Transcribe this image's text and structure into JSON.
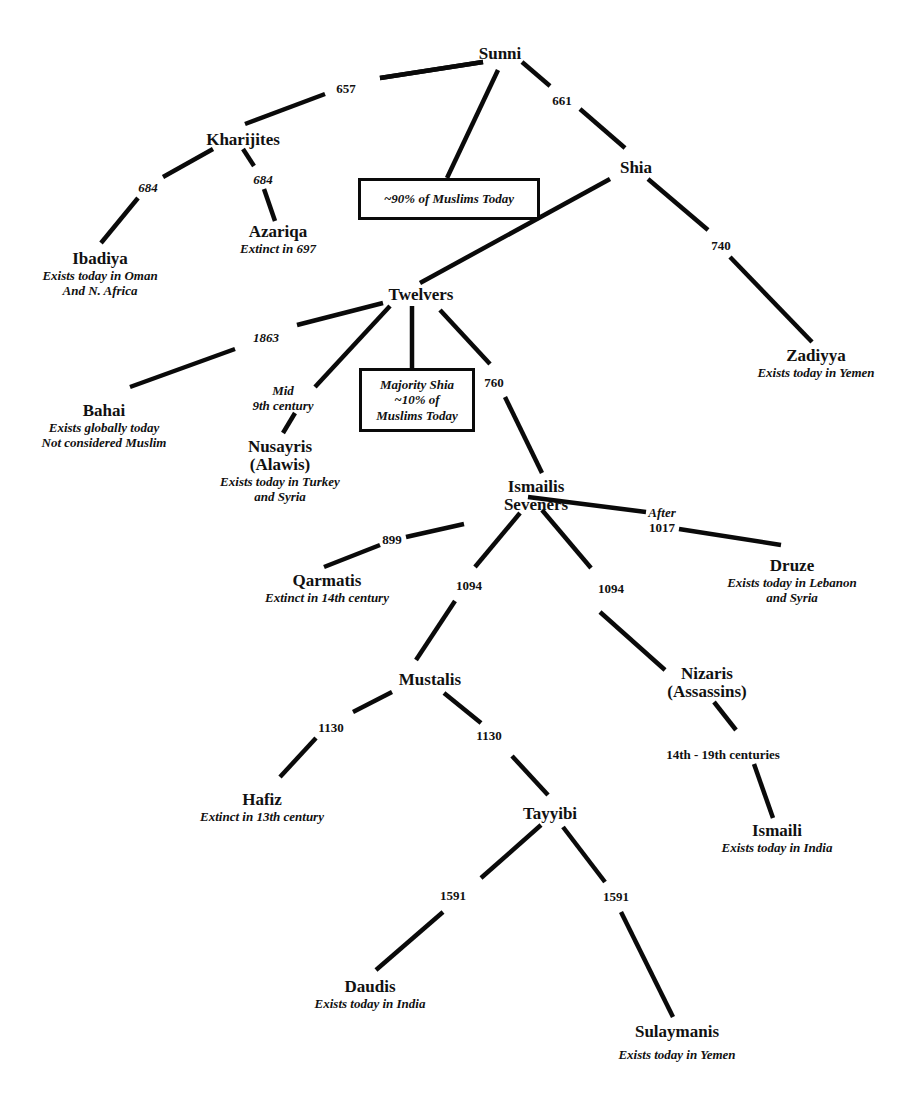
{
  "diagram": {
    "nodes": {
      "sunni": {
        "name": "Sunni"
      },
      "kharijites": {
        "name": "Kharijites"
      },
      "ibadiya": {
        "name": "Ibadiya",
        "note1": "Exists today in Oman",
        "note2": "And N. Africa"
      },
      "azariqa": {
        "name": "Azariqa",
        "note1": "Extinct in 697"
      },
      "shia": {
        "name": "Shia"
      },
      "zadiyya": {
        "name": "Zadiyya",
        "note1": "Exists today in Yemen"
      },
      "twelvers": {
        "name": "Twelvers"
      },
      "bahai": {
        "name": "Bahai",
        "note1": "Exists globally today",
        "note2": "Not considered Muslim"
      },
      "nusayris": {
        "name": "Nusayris",
        "name2": "(Alawis)",
        "note1": "Exists today in Turkey",
        "note2": "and Syria"
      },
      "ismailis": {
        "name": "Ismailis",
        "name2": "Seveners"
      },
      "qarmatis": {
        "name": "Qarmatis",
        "note1": "Extinct in 14th century"
      },
      "druze": {
        "name": "Druze",
        "note1": "Exists today in Lebanon",
        "note2": "and Syria"
      },
      "mustalis": {
        "name": "Mustalis"
      },
      "nizaris": {
        "name": "Nizaris",
        "name2": "(Assassins)"
      },
      "hafiz": {
        "name": "Hafiz",
        "note1": "Extinct in 13th century"
      },
      "tayyibi": {
        "name": "Tayyibi"
      },
      "ismaili": {
        "name": "Ismaili",
        "note1": "Exists today in India"
      },
      "daudis": {
        "name": "Daudis",
        "note1": "Exists today in India"
      },
      "sulaymanis": {
        "name": "Sulaymanis",
        "note1": "Exists today in Yemen"
      }
    },
    "boxes": {
      "sunni_share": {
        "line1": "~90% of Muslims Today"
      },
      "twelvers_share": {
        "line1": "Majority Shia",
        "line2": "~10% of",
        "line3": "Muslims Today"
      }
    },
    "edges": {
      "sunni_kharijites": "657",
      "sunni_shia": "661",
      "kharijites_ibadiya": "684",
      "kharijites_azariqa": "684",
      "shia_zadiyya": "740",
      "twelvers_bahai": "1863",
      "twelvers_nusayris_1": "Mid",
      "twelvers_nusayris_2": "9th century",
      "twelvers_ismailis": "760",
      "ismailis_qarmatis": "899",
      "ismailis_druze_1": "After",
      "ismailis_druze_2": "1017",
      "ismailis_mustalis": "1094",
      "ismailis_nizaris": "1094",
      "mustalis_hafiz": "1130",
      "mustalis_tayyibi": "1130",
      "nizaris_ismaili": "14th - 19th centuries",
      "tayyibi_daudis": "1591",
      "tayyibi_sulaymanis": "1591"
    },
    "colors": {
      "line": "#0a0a0a",
      "text": "#111111",
      "background": "#ffffff"
    }
  }
}
